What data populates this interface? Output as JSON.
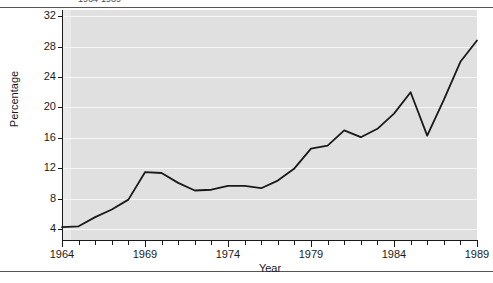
{
  "figure": {
    "title_fragment": "1964-1989",
    "ylabel": "Percentage",
    "xlabel": "Year"
  },
  "axes": {
    "y_ticks": [
      32,
      28,
      24,
      20,
      16,
      12,
      8,
      4
    ],
    "x_ticks_major": [
      1964,
      1969,
      1974,
      1979,
      1984,
      1989
    ]
  },
  "colors": {
    "panel_background": "#e0e0e0",
    "panel_left_band": "#e9e9e9",
    "gridline": "#f6f6f6",
    "series_line": "#1a1a1a",
    "axis": "#1a1a1a",
    "page_background": "#ffffff",
    "rule": "#555555"
  },
  "chart_data": {
    "type": "line",
    "title": "1964-1989",
    "xlabel": "Year",
    "ylabel": "Percentage",
    "xlim": [
      1964,
      1989
    ],
    "ylim": [
      2.6,
      32.8
    ],
    "grid": true,
    "legend": null,
    "x": [
      1964,
      1965,
      1966,
      1967,
      1968,
      1969,
      1970,
      1971,
      1972,
      1973,
      1974,
      1975,
      1976,
      1977,
      1978,
      1979,
      1980,
      1981,
      1982,
      1983,
      1984,
      1985,
      1986,
      1987,
      1988,
      1989
    ],
    "series": [
      {
        "name": "Percentage",
        "values": [
          4.3,
          4.4,
          5.6,
          6.6,
          7.9,
          11.5,
          11.4,
          10.1,
          9.1,
          9.2,
          9.7,
          9.7,
          9.4,
          10.4,
          12.0,
          14.6,
          15.0,
          17.0,
          16.1,
          17.2,
          19.2,
          22.0,
          16.3,
          21.0,
          26.0,
          28.8
        ]
      }
    ]
  }
}
